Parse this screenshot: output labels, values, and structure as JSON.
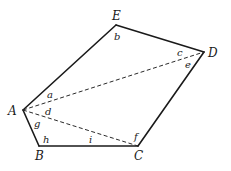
{
  "diagram": {
    "type": "pentagon-with-diagonals",
    "vertices": [
      {
        "id": "A",
        "label": "A",
        "x": 23,
        "y": 110,
        "lx": 8,
        "ly": 115
      },
      {
        "id": "B",
        "label": "B",
        "x": 39,
        "y": 146,
        "lx": 35,
        "ly": 160
      },
      {
        "id": "C",
        "label": "C",
        "x": 138,
        "y": 146,
        "lx": 134,
        "ly": 160
      },
      {
        "id": "D",
        "label": "D",
        "x": 204,
        "y": 52,
        "lx": 208,
        "ly": 57
      },
      {
        "id": "E",
        "label": "E",
        "x": 116,
        "y": 25,
        "lx": 112,
        "ly": 20
      }
    ],
    "edges": [
      [
        "A",
        "B"
      ],
      [
        "B",
        "C"
      ],
      [
        "C",
        "D"
      ],
      [
        "D",
        "E"
      ],
      [
        "E",
        "A"
      ]
    ],
    "diagonals": [
      [
        "A",
        "D"
      ],
      [
        "A",
        "C"
      ]
    ],
    "angle_labels": [
      {
        "label": "a",
        "x": 47,
        "y": 98
      },
      {
        "label": "b",
        "x": 114,
        "y": 40
      },
      {
        "label": "c",
        "x": 177,
        "y": 56
      },
      {
        "label": "d",
        "x": 45,
        "y": 115
      },
      {
        "label": "e",
        "x": 185,
        "y": 68
      },
      {
        "label": "f",
        "x": 134,
        "y": 140
      },
      {
        "label": "g",
        "x": 34,
        "y": 127
      },
      {
        "label": "h",
        "x": 43,
        "y": 143
      },
      {
        "label": "i",
        "x": 89,
        "y": 143
      }
    ]
  }
}
